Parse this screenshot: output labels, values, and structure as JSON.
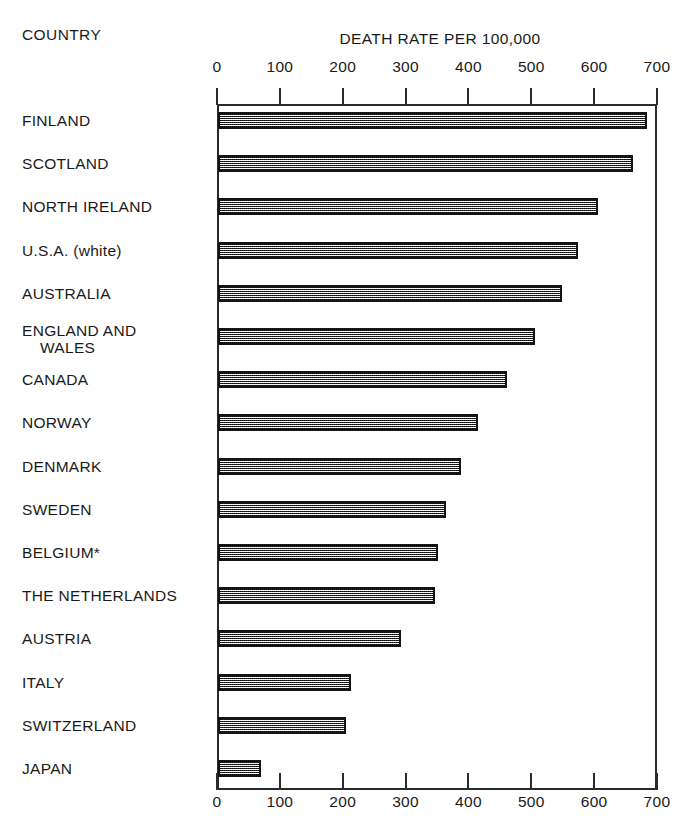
{
  "header": {
    "country_label": "COUNTRY",
    "title": "DEATH RATE PER 100,000"
  },
  "chart_data": {
    "type": "bar",
    "orientation": "horizontal",
    "title": "DEATH RATE PER 100,000",
    "xlabel": "DEATH RATE PER 100,000",
    "ylabel": "COUNTRY",
    "xlim": [
      0,
      700
    ],
    "xticks": [
      0,
      100,
      200,
      300,
      400,
      500,
      600,
      700
    ],
    "xtick_labels": [
      "0",
      "100",
      "200",
      "300",
      "400",
      "500",
      "600",
      "700"
    ],
    "grid": false,
    "legend": null,
    "axis_top": true,
    "axis_bottom": true,
    "categories": [
      "FINLAND",
      "SCOTLAND",
      "NORTH IRELAND",
      "U.S.A. (white)",
      "AUSTRALIA",
      "ENGLAND AND\nWALES",
      "CANADA",
      "NORWAY",
      "DENMARK",
      "SWEDEN",
      "BELGIUM*",
      "THE NETHERLANDS",
      "AUSTRIA",
      "ITALY",
      "SWITZERLAND",
      "JAPAN"
    ],
    "values": [
      683,
      660,
      605,
      572,
      548,
      505,
      460,
      413,
      387,
      363,
      350,
      345,
      291,
      211,
      204,
      68
    ],
    "annotations": [
      "*"
    ]
  },
  "rows": [
    {
      "label": "FINLAND",
      "value": 683
    },
    {
      "label": "SCOTLAND",
      "value": 660
    },
    {
      "label": "NORTH IRELAND",
      "value": 605
    },
    {
      "label": "U.S.A. (white)",
      "value": 572
    },
    {
      "label": "AUSTRALIA",
      "value": 548
    },
    {
      "label": "ENGLAND AND\nWALES",
      "value": 505
    },
    {
      "label": "CANADA",
      "value": 460
    },
    {
      "label": "NORWAY",
      "value": 413
    },
    {
      "label": "DENMARK",
      "value": 387
    },
    {
      "label": "SWEDEN",
      "value": 363
    },
    {
      "label": "BELGIUM*",
      "value": 350
    },
    {
      "label": "THE NETHERLANDS",
      "value": 345
    },
    {
      "label": "AUSTRIA",
      "value": 291
    },
    {
      "label": "ITALY",
      "value": 211
    },
    {
      "label": "SWITZERLAND",
      "value": 204
    },
    {
      "label": "JAPAN",
      "value": 68
    }
  ],
  "colors": {
    "ink": "#1a1a1a",
    "axis": "#2b2b2b",
    "bar_fill": "#a8a8a8",
    "bar_border": "#141414",
    "background": "#ffffff"
  }
}
